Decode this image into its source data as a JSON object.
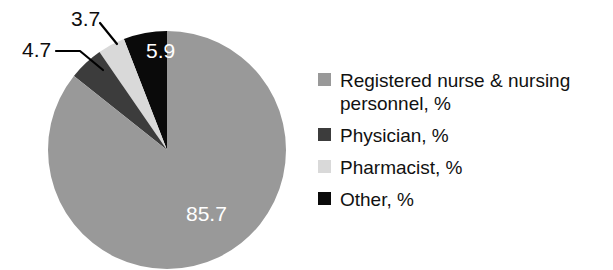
{
  "chart_data": {
    "type": "pie",
    "title": "",
    "subtitle": "",
    "xlabel": "",
    "ylabel": "",
    "legend_position": "right",
    "grid": false,
    "start_angle_deg": 90,
    "direction": "counterclockwise",
    "categories": [
      "Registered nurse & nursing personnel, %",
      "Physician, %",
      "Pharmacist, %",
      "Other, %"
    ],
    "values": [
      85.7,
      4.7,
      3.7,
      5.9
    ],
    "colors": [
      "#999999",
      "#3c3c3c",
      "#d9d9d9",
      "#0a0a0a"
    ],
    "slices": [
      {
        "label": "Registered nurse & nursing personnel, %",
        "short_label": "Registered nurse & nursing personnel",
        "value": 85.7,
        "value_text": "85.7",
        "color": "#999999",
        "label_placement": "inside",
        "label_color": "#ffffff"
      },
      {
        "label": "Physician, %",
        "short_label": "Physician",
        "value": 4.7,
        "value_text": "4.7",
        "color": "#3c3c3c",
        "label_placement": "outside",
        "label_color": "#0d0d0d",
        "has_leader_line": true
      },
      {
        "label": "Pharmacist, %",
        "short_label": "Pharmacist",
        "value": 3.7,
        "value_text": "3.7",
        "color": "#d9d9d9",
        "label_placement": "outside",
        "label_color": "#0d0d0d",
        "has_leader_line": true
      },
      {
        "label": "Other, %",
        "short_label": "Other",
        "value": 5.9,
        "value_text": "5.9",
        "color": "#0a0a0a",
        "label_placement": "inside",
        "label_color": "#ffffff"
      }
    ]
  },
  "legend": {
    "items": [
      {
        "label": "Registered nurse & nursing personnel, %",
        "color": "#999999"
      },
      {
        "label": "Physician, %",
        "color": "#3c3c3c"
      },
      {
        "label": "Pharmacist, %",
        "color": "#d9d9d9"
      },
      {
        "label": "Other, %",
        "color": "#0a0a0a"
      }
    ]
  },
  "palette": {
    "background": "#ffffff",
    "text": "#111111",
    "inside_label": "#ffffff",
    "leader_line": "#000000"
  }
}
